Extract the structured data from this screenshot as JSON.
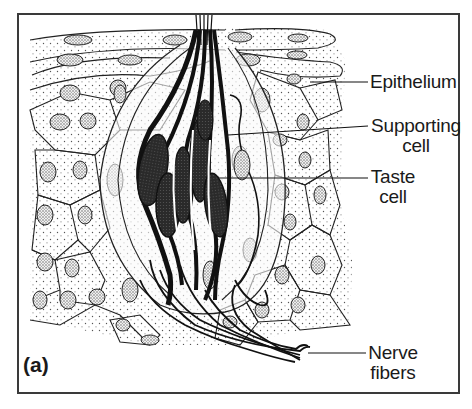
{
  "figure": {
    "panel_label": "(a)",
    "labels": {
      "epithelium": "Epithelium",
      "supporting_cell_line1": "Supporting",
      "supporting_cell_line2": "cell",
      "taste_cell_line1": "Taste",
      "taste_cell_line2": "cell",
      "nerve_fibers_line1": "Nerve",
      "nerve_fibers_line2": "fibers"
    },
    "colors": {
      "ink": "#1a1a1a",
      "frame": "#3a3a3a",
      "taste_cell_fill": "#2b2b2b",
      "background": "#ffffff"
    }
  }
}
